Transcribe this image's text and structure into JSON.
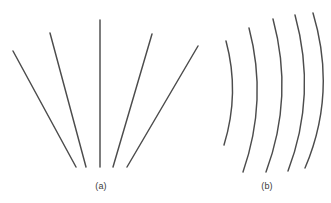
{
  "figure": {
    "background_color": "#ffffff",
    "stroke_color": "#4c4c4c",
    "stroke_width": 1.45,
    "width": 331,
    "height": 203
  },
  "panels": [
    {
      "id": "panel-a",
      "caption": "(a)",
      "caption_x": 101,
      "caption_y": 181,
      "description": "fan of straight lines radiating from a common point near the bottom center",
      "element_type": "straight-lines",
      "count": 6,
      "lines": [
        {
          "name": "line-1",
          "x1": 13,
          "y1": 51,
          "x2": 76,
          "y2": 167
        },
        {
          "name": "line-2",
          "x1": 50,
          "y1": 33,
          "x2": 86,
          "y2": 167
        },
        {
          "name": "line-3",
          "x1": 100,
          "y1": 20,
          "x2": 100,
          "y2": 167
        },
        {
          "name": "line-4",
          "x1": 152,
          "y1": 34,
          "x2": 113,
          "y2": 167
        },
        {
          "name": "line-5",
          "x1": 198,
          "y1": 46,
          "x2": 127,
          "y2": 167
        }
      ]
    },
    {
      "id": "panel-b",
      "caption": "(b)",
      "caption_x": 267,
      "caption_y": 181,
      "description": "series of concentric curved arcs bowing to the right",
      "element_type": "arcs",
      "count": 5,
      "arcs": [
        {
          "name": "arc-1",
          "x1": 226,
          "y1": 41,
          "cx": 240,
          "cy": 93,
          "x2": 224,
          "y2": 145
        },
        {
          "name": "arc-2",
          "x1": 249,
          "y1": 28,
          "cx": 268,
          "cy": 100,
          "x2": 243,
          "y2": 172
        },
        {
          "name": "arc-3",
          "x1": 273,
          "y1": 19,
          "cx": 294,
          "cy": 97,
          "x2": 266,
          "y2": 172
        },
        {
          "name": "arc-4",
          "x1": 295,
          "y1": 15,
          "cx": 317,
          "cy": 95,
          "x2": 288,
          "y2": 171
        },
        {
          "name": "arc-5",
          "x1": 313,
          "y1": 13,
          "cx": 337,
          "cy": 93,
          "x2": 305,
          "y2": 168
        }
      ]
    }
  ]
}
